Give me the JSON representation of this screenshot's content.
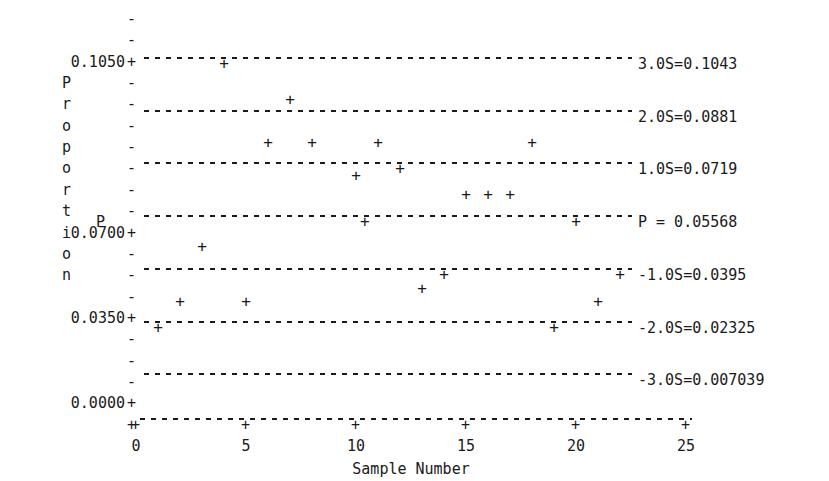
{
  "chart_data": {
    "type": "scatter",
    "title": "",
    "xlabel": "Sample Number",
    "ylabel": "Proportion",
    "ylabel_chars": [
      "P",
      "r",
      "o",
      "p",
      "o",
      "r",
      "t",
      "i",
      "o",
      "n"
    ],
    "xlim": [
      0,
      25
    ],
    "ylim": [
      0.0,
      0.1225
    ],
    "xticks": [
      0,
      5,
      10,
      15,
      20,
      25
    ],
    "xtick_labels": [
      "0",
      "5",
      "10",
      "15",
      "20",
      "25"
    ],
    "yticks": [
      0.105,
      0.07,
      0.035,
      0.0
    ],
    "ytick_labels": [
      "0.1050",
      "0.0700",
      "0.0350",
      "0.0000"
    ],
    "grid": false,
    "control_limits": [
      {
        "name": "3.0S",
        "label": "3.0S=0.1043",
        "value": 0.1043
      },
      {
        "name": "2.0S",
        "label": "2.0S=0.0881",
        "value": 0.0881
      },
      {
        "name": "1.0S",
        "label": "1.0S=0.0719",
        "value": 0.0719
      },
      {
        "name": "P",
        "label": "P = 0.05568",
        "value": 0.05568
      },
      {
        "name": "-1.0S",
        "label": "-1.0S=0.0395",
        "value": 0.0395
      },
      {
        "name": "-2.0S",
        "label": "-2.0S=0.02325",
        "value": 0.02325
      },
      {
        "name": "-3.0S",
        "label": "-3.0S=0.007039",
        "value": 0.007039
      }
    ],
    "center_marker_label": "P",
    "marker": "+",
    "x": [
      1,
      2,
      3,
      4,
      5,
      6,
      7,
      8,
      9,
      10,
      11,
      12,
      13,
      14,
      15,
      16,
      17,
      18,
      19,
      20,
      21,
      22
    ],
    "values": [
      0.02325,
      0.031,
      0.048,
      0.1043,
      0.031,
      0.08,
      0.0933,
      0.08,
      0.0719,
      0.07,
      0.08,
      0.064,
      0.035,
      0.0395,
      0.064,
      0.064,
      0.08,
      0.023,
      0.0557,
      0.031,
      0.0395,
      0.1043
    ],
    "series": [
      {
        "name": "Sample proportion",
        "points": [
          {
            "x": 1,
            "y": 0.02325
          },
          {
            "x": 2,
            "y": 0.031
          },
          {
            "x": 3,
            "y": 0.048
          },
          {
            "x": 4,
            "y": 0.1043
          },
          {
            "x": 5,
            "y": 0.031
          },
          {
            "x": 6,
            "y": 0.08
          },
          {
            "x": 7,
            "y": 0.0933
          },
          {
            "x": 8,
            "y": 0.08
          },
          {
            "x": 10,
            "y": 0.07
          },
          {
            "x": 11,
            "y": 0.08
          },
          {
            "x": 12,
            "y": 0.0719
          },
          {
            "x": 13,
            "y": 0.035
          },
          {
            "x": 14,
            "y": 0.0395
          },
          {
            "x": 15,
            "y": 0.064
          },
          {
            "x": 16,
            "y": 0.064
          },
          {
            "x": 17,
            "y": 0.064
          },
          {
            "x": 18,
            "y": 0.08
          },
          {
            "x": 19,
            "y": 0.023
          },
          {
            "x": 20,
            "y": 0.0557
          },
          {
            "x": 21,
            "y": 0.031
          },
          {
            "x": 22,
            "y": 0.0395
          },
          {
            "x": 10.4,
            "y": 0.05568
          }
        ]
      }
    ]
  }
}
